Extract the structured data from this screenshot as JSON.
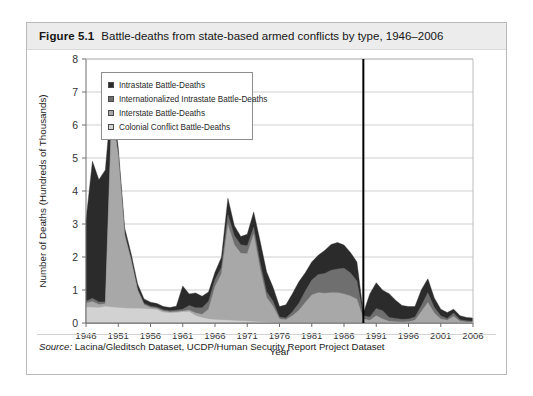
{
  "figure": {
    "number": "Figure 5.1",
    "title": "Battle-deaths from state-based armed conflicts by type, 1946–2006",
    "source_label": "Source:",
    "source_text": " Lacina/Gleditsch Dataset, UCDP/Human Security Report Project Dataset"
  },
  "colors": {
    "intrastate": "#2b2b2b",
    "internationalized": "#6f6f6f",
    "interstate": "#a8a8a8",
    "colonial": "#d2d2d2",
    "gridline": "#cfcfcf",
    "axis": "#6e6e6e",
    "marker_line": "#000000",
    "title_band": "#ececec",
    "card_border": "#b9b9b9"
  },
  "chart_data": {
    "type": "area",
    "stacked": true,
    "title": "Battle-deaths from state-based armed conflicts by type, 1946–2006",
    "xlabel": "Year",
    "ylabel": "Number of Deaths (Hundreds of Thousands)",
    "xlim": [
      1946,
      2006
    ],
    "ylim": [
      0,
      8
    ],
    "yticks": [
      0,
      1,
      2,
      3,
      4,
      5,
      6,
      7,
      8
    ],
    "xticks": [
      1946,
      1951,
      1956,
      1961,
      1966,
      1971,
      1976,
      1981,
      1986,
      1991,
      1996,
      2001,
      2006
    ],
    "grid": "horizontal",
    "legend_position": "top-left-inside",
    "annotations": [
      {
        "type": "vline",
        "x": 1989,
        "label": ""
      }
    ],
    "x": [
      1946,
      1947,
      1948,
      1949,
      1950,
      1951,
      1952,
      1953,
      1954,
      1955,
      1956,
      1957,
      1958,
      1959,
      1960,
      1961,
      1962,
      1963,
      1964,
      1965,
      1966,
      1967,
      1968,
      1969,
      1970,
      1971,
      1972,
      1973,
      1974,
      1975,
      1976,
      1977,
      1978,
      1979,
      1980,
      1981,
      1982,
      1983,
      1984,
      1985,
      1986,
      1987,
      1988,
      1989,
      1990,
      1991,
      1992,
      1993,
      1994,
      1995,
      1996,
      1997,
      1998,
      1999,
      2000,
      2001,
      2002,
      2003,
      2004,
      2005,
      2006
    ],
    "series": [
      {
        "name": "Colonial Conflict Battle-Deaths",
        "key": "colonial",
        "color": "#d2d2d2",
        "values": [
          0.48,
          0.47,
          0.46,
          0.5,
          0.48,
          0.46,
          0.45,
          0.44,
          0.44,
          0.43,
          0.42,
          0.4,
          0.32,
          0.3,
          0.31,
          0.33,
          0.34,
          0.22,
          0.16,
          0.12,
          0.1,
          0.09,
          0.08,
          0.07,
          0.06,
          0.05,
          0.04,
          0.03,
          0.02,
          0.01,
          0.0,
          0.0,
          0.0,
          0.0,
          0.0,
          0.0,
          0.0,
          0.0,
          0.0,
          0.0,
          0.0,
          0.0,
          0.0,
          0.0,
          0.0,
          0.0,
          0.0,
          0.0,
          0.0,
          0.0,
          0.0,
          0.0,
          0.0,
          0.0,
          0.0,
          0.0,
          0.0,
          0.0,
          0.0,
          0.0,
          0.0
        ]
      },
      {
        "name": "Interstate Battle-Deaths",
        "key": "interstate",
        "color": "#a8a8a8",
        "values": [
          0.12,
          0.18,
          0.1,
          0.08,
          5.95,
          4.6,
          2.2,
          1.45,
          0.55,
          0.12,
          0.05,
          0.04,
          0.04,
          0.03,
          0.03,
          0.03,
          0.05,
          0.08,
          0.1,
          0.3,
          1.0,
          1.4,
          2.9,
          2.3,
          2.05,
          2.05,
          2.65,
          1.6,
          0.75,
          0.5,
          0.12,
          0.1,
          0.22,
          0.38,
          0.62,
          0.85,
          0.92,
          0.9,
          0.92,
          0.92,
          0.88,
          0.82,
          0.72,
          0.12,
          0.08,
          0.22,
          0.12,
          0.05,
          0.04,
          0.03,
          0.04,
          0.08,
          0.35,
          0.62,
          0.3,
          0.12,
          0.08,
          0.2,
          0.05,
          0.03,
          0.02
        ]
      },
      {
        "name": "Internationalized Intrastate Battle-Deaths",
        "key": "internationalized",
        "color": "#6f6f6f",
        "values": [
          0.06,
          0.1,
          0.08,
          0.06,
          0.05,
          0.05,
          0.05,
          0.05,
          0.04,
          0.04,
          0.04,
          0.04,
          0.04,
          0.04,
          0.05,
          0.06,
          0.14,
          0.16,
          0.2,
          0.24,
          0.22,
          0.2,
          0.3,
          0.28,
          0.26,
          0.24,
          0.22,
          0.2,
          0.18,
          0.15,
          0.06,
          0.05,
          0.12,
          0.22,
          0.35,
          0.45,
          0.55,
          0.6,
          0.68,
          0.72,
          0.78,
          0.7,
          0.55,
          0.1,
          0.1,
          0.22,
          0.25,
          0.12,
          0.1,
          0.08,
          0.08,
          0.1,
          0.18,
          0.3,
          0.18,
          0.1,
          0.06,
          0.1,
          0.05,
          0.04,
          0.03
        ]
      },
      {
        "name": "Intrastate Battle-Deaths",
        "key": "intrastate",
        "color": "#2b2b2b",
        "values": [
          2.45,
          4.15,
          3.7,
          4.0,
          0.42,
          0.2,
          0.18,
          0.16,
          0.15,
          0.14,
          0.12,
          0.11,
          0.1,
          0.1,
          0.12,
          0.7,
          0.35,
          0.45,
          0.35,
          0.28,
          0.22,
          0.3,
          0.5,
          0.3,
          0.25,
          0.35,
          0.45,
          0.65,
          0.6,
          0.42,
          0.32,
          0.4,
          0.55,
          0.65,
          0.55,
          0.55,
          0.58,
          0.7,
          0.78,
          0.8,
          0.7,
          0.62,
          0.58,
          0.08,
          0.7,
          0.78,
          0.62,
          0.72,
          0.55,
          0.42,
          0.38,
          0.32,
          0.48,
          0.42,
          0.28,
          0.2,
          0.18,
          0.12,
          0.12,
          0.1,
          0.1
        ]
      }
    ]
  },
  "legend": {
    "items": [
      {
        "label": "Intrastate Battle-Deaths",
        "color": "#2b2b2b"
      },
      {
        "label": "Internationalized Intrastate Battle-Deaths",
        "color": "#6f6f6f"
      },
      {
        "label": "Interstate Battle-Deaths",
        "color": "#a8a8a8"
      },
      {
        "label": "Colonial Conflict Battle-Deaths",
        "color": "#d2d2d2"
      }
    ]
  }
}
